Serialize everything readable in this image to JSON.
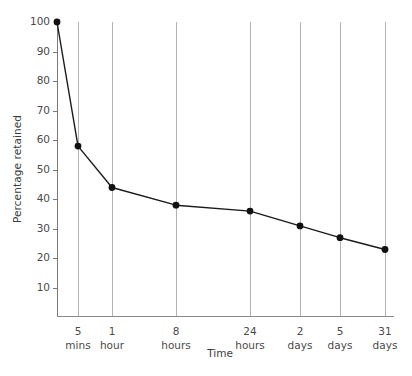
{
  "chart_data": {
    "type": "line",
    "title": "",
    "xlabel": "Time",
    "ylabel": "Percentage retained",
    "categories": [
      "0",
      "5 mins",
      "1 hour",
      "8 hours",
      "24 hours",
      "2 days",
      "5 days",
      "31 days"
    ],
    "x_tick_labels": [
      {
        "line1": "5",
        "line2": "mins"
      },
      {
        "line1": "1",
        "line2": "hour"
      },
      {
        "line1": "8",
        "line2": "hours"
      },
      {
        "line1": "24",
        "line2": "hours"
      },
      {
        "line1": "2",
        "line2": "days"
      },
      {
        "line1": "5",
        "line2": "days"
      },
      {
        "line1": "31",
        "line2": "days"
      }
    ],
    "values": [
      100,
      58,
      44,
      38,
      36,
      31,
      27,
      23
    ],
    "y_tick_labels": [
      "100",
      "90",
      "80",
      "70",
      "60",
      "50",
      "40",
      "30",
      "20",
      "10"
    ],
    "y_tick_values": [
      100,
      90,
      80,
      70,
      60,
      50,
      40,
      30,
      20,
      10
    ],
    "ylim": [
      0,
      100
    ],
    "grid": "vertical",
    "legend": "none",
    "series": [
      {
        "name": "Percentage retained",
        "points": [
          {
            "x": "0",
            "y": 100
          },
          {
            "x": "5 mins",
            "y": 58
          },
          {
            "x": "1 hour",
            "y": 44
          },
          {
            "x": "8 hours",
            "y": 38
          },
          {
            "x": "24 hours",
            "y": 36
          },
          {
            "x": "2 days",
            "y": 31
          },
          {
            "x": "5 days",
            "y": 27
          },
          {
            "x": "31 days",
            "y": 23
          }
        ]
      }
    ],
    "colors": {
      "line": "#1a1a1a",
      "marker": "#111111",
      "gridline": "#b3b3b3",
      "axis": "#7a7a7a",
      "tick_label": "#4a4a4a",
      "axis_title": "#3d3d3d",
      "background": "#ffffff"
    }
  }
}
